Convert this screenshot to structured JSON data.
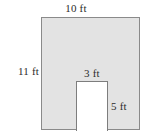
{
  "figure": {
    "colors": {
      "shaded_fill": "#e3e3e3",
      "outline": "#8a8a8a",
      "notch_fill": "#ffffff",
      "label_text": "#2b2b2b",
      "background": "#ffffff"
    },
    "labels": {
      "outer_width": "10 ft",
      "outer_height": "11 ft",
      "notch_width": "3 ft",
      "notch_height": "5 ft"
    }
  },
  "chart_data": {
    "type": "diagram",
    "title": "",
    "shapes": [
      {
        "name": "outer-rectangle",
        "role": "shaded-region",
        "width": 10,
        "height": 11,
        "units": "ft",
        "fill": "#e3e3e3"
      },
      {
        "name": "inner-rectangle",
        "role": "cutout-notch",
        "width": 3,
        "height": 5,
        "units": "ft",
        "fill": "#ffffff",
        "position": "bottom-edge, right-of-center"
      }
    ],
    "annotations": [
      {
        "text": "10 ft",
        "target": "outer-rectangle",
        "edge": "top",
        "value": 10,
        "units": "ft"
      },
      {
        "text": "11 ft",
        "target": "outer-rectangle",
        "edge": "left",
        "value": 11,
        "units": "ft"
      },
      {
        "text": "3 ft",
        "target": "inner-rectangle",
        "edge": "top",
        "value": 3,
        "units": "ft"
      },
      {
        "text": "5 ft",
        "target": "inner-rectangle",
        "edge": "right",
        "value": 5,
        "units": "ft"
      }
    ]
  }
}
